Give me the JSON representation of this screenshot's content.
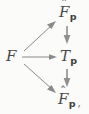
{
  "figure": {
    "kind": "commutative-diagram",
    "background_color": "#fbfbfa",
    "ink_color": "#4a4a4a",
    "arrow_color": "#8a8a8a",
    "nodes": {
      "source": {
        "base": "F",
        "accent": "",
        "subscript": "",
        "punctuation": ""
      },
      "top_right": {
        "base": "F",
        "accent": "ˆ",
        "subscript": "p",
        "punctuation": ""
      },
      "middle_right": {
        "base": "T",
        "accent": "",
        "subscript": "p",
        "punctuation": ""
      },
      "bottom_right": {
        "base": "F",
        "accent": "ˆ",
        "subscript": "p",
        "punctuation": ","
      }
    },
    "arrows": [
      {
        "name": "diagonal-up",
        "from": "source",
        "to": "top_right",
        "label": ""
      },
      {
        "name": "horizontal",
        "from": "source",
        "to": "middle_right",
        "label": ""
      },
      {
        "name": "diagonal-down",
        "from": "source",
        "to": "bottom_right",
        "label": ""
      },
      {
        "name": "vertical-top",
        "from": "top_right",
        "to": "middle_right",
        "label": ""
      },
      {
        "name": "vertical-bot",
        "from": "middle_right",
        "to": "bottom_right",
        "label": ""
      }
    ]
  }
}
